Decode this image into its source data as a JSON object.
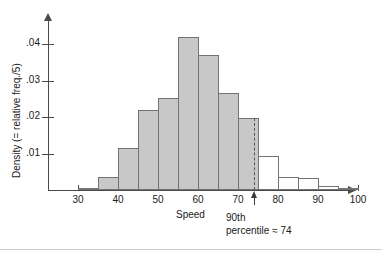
{
  "chart_data": {
    "type": "bar",
    "title": "",
    "subtitle": "",
    "xlabel": "Speed",
    "ylabel": "Density (= relative freq./5)",
    "xlim": [
      25,
      102
    ],
    "ylim": [
      0,
      0.0455
    ],
    "grid": false,
    "legend": null,
    "bin_width": 5,
    "categories": [
      "30-35",
      "35-40",
      "40-45",
      "45-50",
      "50-55",
      "55-60",
      "60-65",
      "65-70",
      "70-75",
      "75-80",
      "80-85",
      "85-90",
      "90-95",
      "95-100"
    ],
    "bin_starts": [
      30,
      35,
      40,
      45,
      50,
      55,
      60,
      65,
      70,
      75,
      80,
      85,
      90,
      95
    ],
    "values": [
      0.0005,
      0.0035,
      0.0115,
      0.022,
      0.0253,
      0.042,
      0.037,
      0.0265,
      0.0197,
      0.0092,
      0.0035,
      0.0032,
      0.0012,
      0.0005
    ],
    "bar_styles": [
      "filled",
      "filled",
      "filled",
      "filled",
      "filled",
      "filled",
      "filled",
      "filled",
      "filled",
      "hollow",
      "hollow",
      "hollow",
      "hollow",
      "hollow"
    ],
    "xticks": [
      30,
      40,
      50,
      60,
      70,
      80,
      90,
      100
    ],
    "xtick_labels": [
      "30",
      "40",
      "50",
      "60",
      "70",
      "80",
      "90",
      "100"
    ],
    "yticks": [
      0.01,
      0.02,
      0.03,
      0.04
    ],
    "ytick_labels": [
      ".01",
      ".02",
      ".03",
      ".04"
    ],
    "annotations": [
      {
        "name": "percentile-marker",
        "x_value": 74,
        "line_1": "90th",
        "line_2": "percentile ≈ 74"
      }
    ]
  },
  "colors": {
    "bar_fill": "#c8c8c8",
    "bar_stroke": "#737373",
    "axis": "#4a4a4a",
    "text": "#1a1a1a",
    "annotation_line": "#555555",
    "background": "#ffffff"
  }
}
